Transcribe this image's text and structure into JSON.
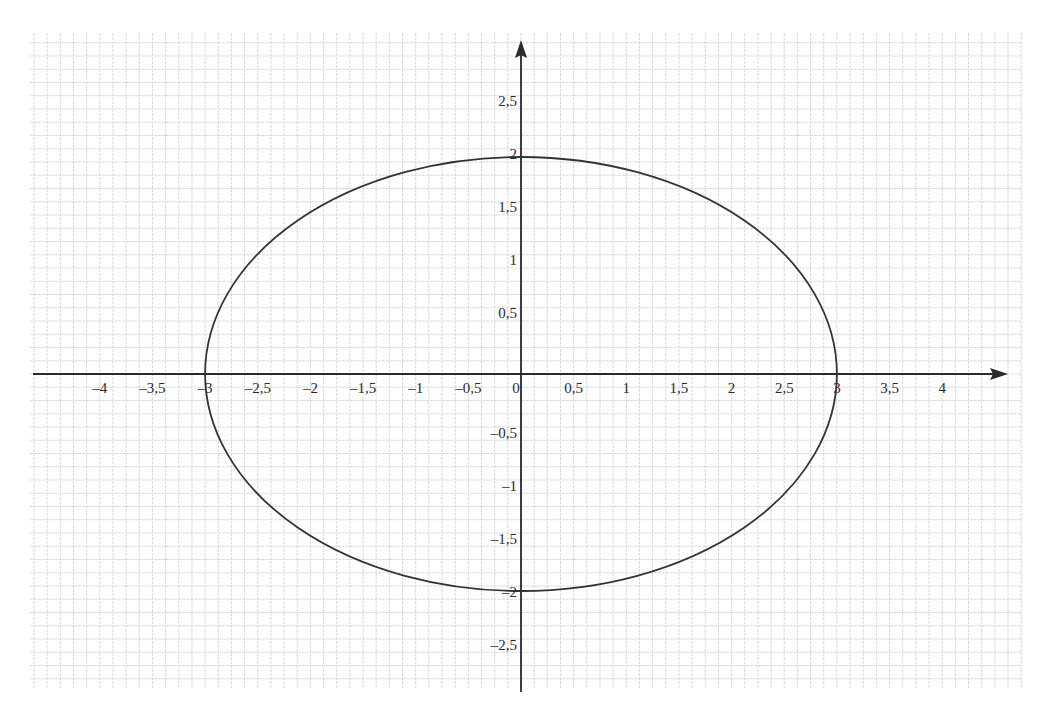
{
  "chart_data": {
    "type": "line",
    "title": "",
    "xlabel": "",
    "ylabel": "",
    "grid": true,
    "grid_minor_step": 0.125,
    "xlim": [
      -4.9,
      4.5
    ],
    "ylim": [
      -2.95,
      3.2
    ],
    "x_ticks": [
      "-4",
      "-3,5",
      "-3",
      "-2,5",
      "-2",
      "-1,5",
      "-1",
      "-0,5",
      "0",
      "0,5",
      "1",
      "1,5",
      "2",
      "2,5",
      "3",
      "3,5",
      "4"
    ],
    "x_tick_values": [
      -4,
      -3.5,
      -3,
      -2.5,
      -2,
      -1.5,
      -1,
      -0.5,
      0,
      0.5,
      1,
      1.5,
      2,
      2.5,
      3,
      3.5,
      4
    ],
    "y_ticks": [
      "2,5",
      "2",
      "1,5",
      "1",
      "0,5",
      "-0,5",
      "-1",
      "-1,5",
      "-2",
      "-2,5"
    ],
    "y_tick_values": [
      2.5,
      2,
      1.5,
      1,
      0.5,
      -0.5,
      -1,
      -1.5,
      -2,
      -2.5
    ],
    "series": [
      {
        "name": "ellipse",
        "shape": "ellipse",
        "center": [
          0,
          0
        ],
        "semi_axis_x": 3,
        "semi_axis_y": 2,
        "x_intercepts": [
          -3,
          3
        ],
        "y_intercepts": [
          -2,
          2
        ]
      }
    ],
    "colors": {
      "axis": "#2a2a2a",
      "curve": "#333333",
      "grid": "#cfcfcf",
      "background": "#ffffff"
    }
  }
}
